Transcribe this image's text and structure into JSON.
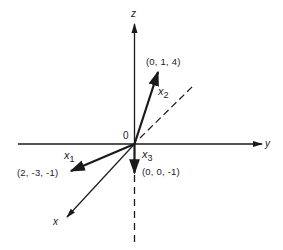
{
  "diagram": {
    "type": "3d-vector-axes",
    "axes": {
      "z": {
        "label": "z"
      },
      "y": {
        "label": "y"
      },
      "x": {
        "label": "x"
      }
    },
    "origin": {
      "label": "0"
    },
    "vectors": [
      {
        "name": "x",
        "index": "1",
        "coords": "(2, -3, -1)"
      },
      {
        "name": "x",
        "index": "2",
        "coords": "(0, 1, 4)"
      },
      {
        "name": "x",
        "index": "3",
        "coords": "(0, 0, -1)"
      }
    ],
    "colors": {
      "line": "#1a1a1a",
      "background": "#ffffff"
    }
  }
}
